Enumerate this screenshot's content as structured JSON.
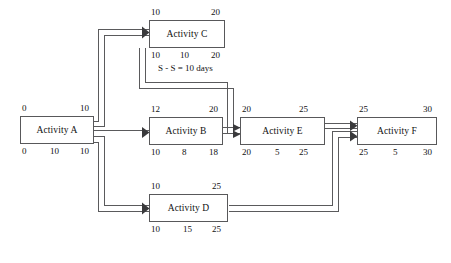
{
  "diagram": {
    "type": "pdm-network",
    "colors": {
      "box_border": "#58585a",
      "connector": "#5a5a5c",
      "text": "#111111",
      "background": "#ffffff"
    },
    "nodes": [
      {
        "id": "A",
        "label": "Activity A",
        "top_left": "0",
        "top_right": "10",
        "bottom_left": "0",
        "bottom_mid": "10",
        "bottom_right": "10"
      },
      {
        "id": "C",
        "label": "Activity C",
        "top_left": "10",
        "top_right": "20",
        "bottom_left": "10",
        "bottom_mid": "10",
        "bottom_right": "20"
      },
      {
        "id": "B",
        "label": "Activity B",
        "top_left": "12",
        "top_right": "20",
        "bottom_left": "10",
        "bottom_mid": "8",
        "bottom_right": "18"
      },
      {
        "id": "E",
        "label": "Activity E",
        "top_left": "20",
        "top_right": "25",
        "bottom_left": "20",
        "bottom_mid": "5",
        "bottom_right": "25"
      },
      {
        "id": "F",
        "label": "Activity F",
        "top_left": "25",
        "top_right": "30",
        "bottom_left": "25",
        "bottom_mid": "5",
        "bottom_right": "30"
      },
      {
        "id": "D",
        "label": "Activity D",
        "top_left": "10",
        "top_right": "25",
        "bottom_left": "10",
        "bottom_mid": "15",
        "bottom_right": "25"
      }
    ],
    "annotations": [
      {
        "id": "ss-lag",
        "text": "S - S = 10 days"
      }
    ],
    "links": [
      {
        "from": "A",
        "to": "C"
      },
      {
        "from": "A",
        "to": "B"
      },
      {
        "from": "A",
        "to": "D"
      },
      {
        "from": "C",
        "to": "E"
      },
      {
        "from": "B",
        "to": "E"
      },
      {
        "from": "E",
        "to": "F"
      },
      {
        "from": "D",
        "to": "F"
      }
    ]
  }
}
